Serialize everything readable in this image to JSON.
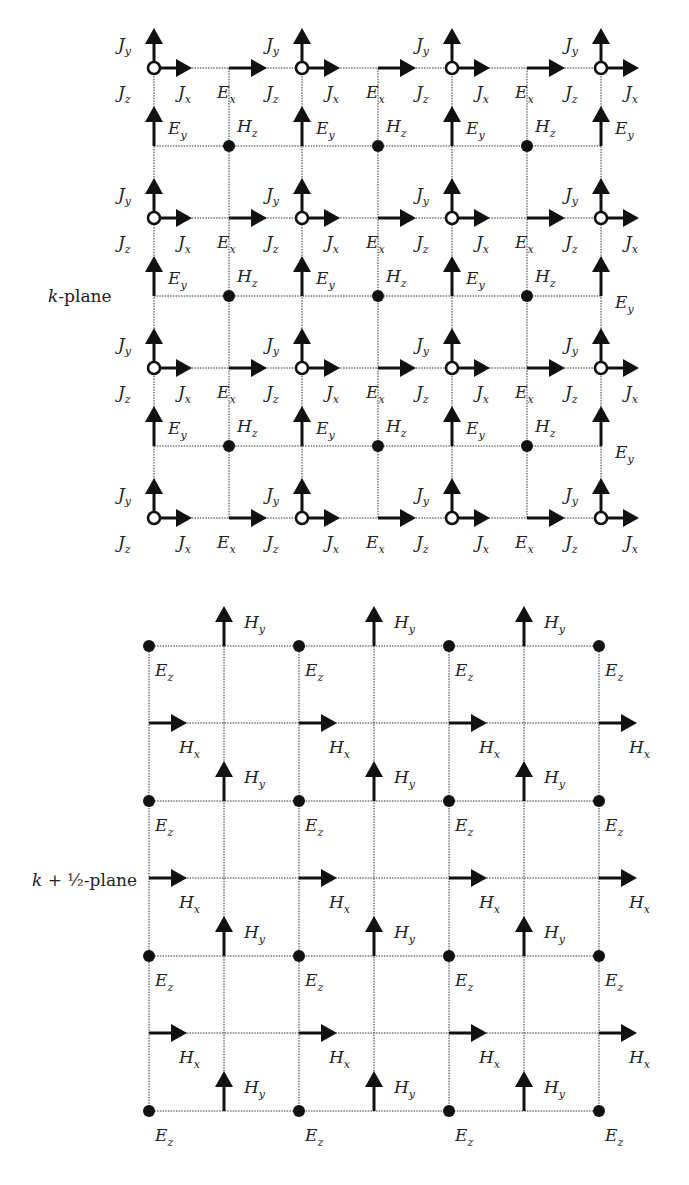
{
  "top_diagram": {
    "plane_label": "k-plane",
    "plane_label_italic": "k",
    "plane_label_rest": "-plane",
    "field_labels": {
      "Jx": {
        "main": "J",
        "sub": "x"
      },
      "Jy": {
        "main": "J",
        "sub": "y"
      },
      "Jz": {
        "main": "J",
        "sub": "z"
      },
      "Ex": {
        "main": "E",
        "sub": "x"
      },
      "Ey": {
        "main": "E",
        "sub": "y"
      },
      "Hz": {
        "main": "H",
        "sub": "z"
      }
    },
    "j_columns_x": [
      154,
      302,
      452,
      601
    ],
    "mid_columns_x": [
      229,
      378,
      527
    ],
    "j_rows_y": [
      68,
      218,
      368,
      518
    ],
    "hz_rows_y": [
      146,
      296,
      446
    ],
    "components": [
      "J_x",
      "J_y",
      "J_z",
      "E_x",
      "E_y",
      "H_z"
    ]
  },
  "bottom_diagram": {
    "plane_label": "k + ½-plane",
    "plane_label_italic": "k",
    "plane_label_rest": " + ½-plane",
    "field_labels": {
      "Ez": {
        "main": "E",
        "sub": "z"
      },
      "Hx": {
        "main": "H",
        "sub": "x"
      },
      "Hy": {
        "main": "H",
        "sub": "y"
      }
    },
    "ez_columns_x": [
      149,
      299,
      449,
      599
    ],
    "hy_columns_x": [
      224,
      374,
      524
    ],
    "ez_rows_y": [
      646,
      801,
      956,
      1111
    ],
    "hx_rows_y": [
      723,
      878,
      1033
    ],
    "components": [
      "E_z",
      "H_x",
      "H_y"
    ]
  }
}
